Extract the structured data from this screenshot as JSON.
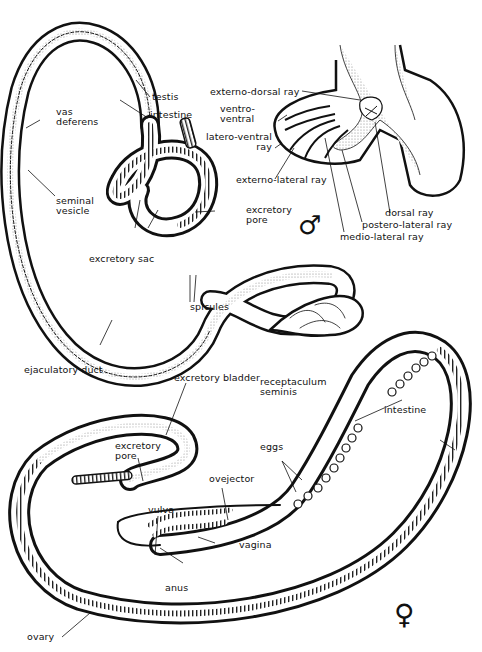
{
  "figure": {
    "male": {
      "symbol": "♂",
      "labels": {
        "testis": "testis",
        "intestine": "intestine",
        "vas_deferens": "vas\ndeferens",
        "seminal_vesicle": "seminal\nvesicle",
        "excretory_pore": "excretory\npore",
        "excretory_sac": "excretory sac",
        "spicules": "spicules",
        "ejaculatory_duct": "ejaculatory duct",
        "externo_dorsal_ray": "externo-dorsal ray",
        "ventro_ventral": "ventro-\nventral",
        "latero_ventral_ray": "latero-ventral\nray",
        "externo_lateral_ray": "externo-lateral ray",
        "dorsal_ray": "dorsal ray",
        "postero_lateral_ray": "postero-lateral ray",
        "medio_lateral_ray": "medio-lateral ray"
      }
    },
    "female": {
      "symbol": "♀",
      "labels": {
        "excretory_bladder": "excretory bladder",
        "receptaculum_seminis": "receptaculum\nseminis",
        "intestine": "intestine",
        "eggs": "eggs",
        "excretory_pore": "excretory\npore",
        "ovejector": "ovejector",
        "vulva": "vulva",
        "vagina": "vagina",
        "anus": "anus",
        "ovary": "ovary"
      }
    },
    "colors": {
      "ink": "#111111",
      "stipple": "#c8c8c8",
      "background": "#ffffff"
    }
  }
}
